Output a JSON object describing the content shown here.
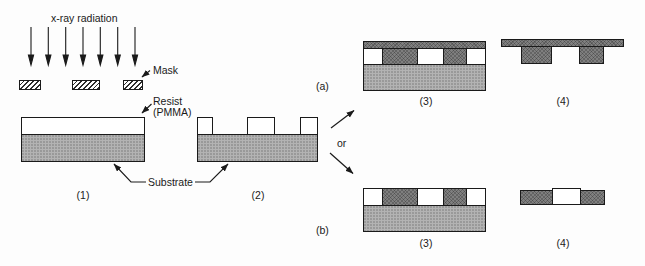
{
  "figure": {
    "radiation_label": "x-ray radiation",
    "mask_label": "Mask",
    "resist_label": "Resist",
    "resist_label_2": "(PMMA)",
    "substrate_label": "Substrate",
    "or_label": "or",
    "branch_a_label": "(a)",
    "branch_b_label": "(b)",
    "step1_label": "(1)",
    "step2_label": "(2)",
    "step3_label": "(3)",
    "step4_label": "(4)"
  },
  "colors": {
    "background": "#fdfdfd",
    "outline": "#1a1a1a",
    "text": "#1a1a1a",
    "substrate_fill": "#b3b3b3",
    "metal_fill": "#7f7f7f",
    "resist_fill": "#ffffff"
  }
}
